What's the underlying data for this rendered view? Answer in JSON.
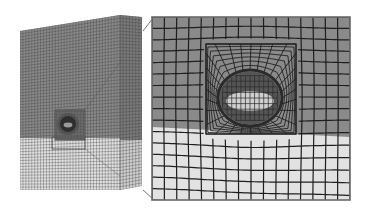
{
  "figure": {
    "colors": {
      "background": "#ffffff",
      "upper_layer": "#8a8a8a",
      "upper_layer_side": "#7a7a7a",
      "lower_layer": "#e2e2e2",
      "lower_layer_side": "#cfcfcf",
      "mesh_line_overview": "#3c3c3c",
      "mesh_line_detail": "#1e1e1e",
      "cavity_core": "#555555",
      "cavity_inner_light": "#cfcfcf",
      "connector_line": "#555555",
      "frame": "#6a6a6a"
    },
    "overview": {
      "front_face": {
        "x0": 20,
        "x1": 120,
        "top_left_y": 31,
        "top_right_y": 15,
        "bottom_y": 190
      },
      "side_face": {
        "x1": 142,
        "top_y": 17,
        "bottom_y": 186
      },
      "layer_interface_y": 138,
      "grid_cols": 34,
      "grid_rows": 54,
      "inset_box": {
        "x": 55,
        "y": 110,
        "w": 30,
        "h": 30
      },
      "detail_marker": {
        "x": 52,
        "y": 137,
        "w": 33,
        "h": 12
      },
      "cavity": {
        "cx": 68,
        "cy": 124,
        "r": 8
      }
    },
    "detail": {
      "frame": {
        "x": 152,
        "y": 17,
        "w": 198,
        "h": 183
      },
      "layer_interface_y_left": 127,
      "layer_interface_y_right": 137,
      "grid_cols": 16,
      "grid_rows": 16,
      "refined_box": {
        "x": 206,
        "y": 44,
        "w": 90,
        "h": 90
      },
      "cavity": {
        "cx": 250,
        "cy": 98,
        "rx": 32,
        "ry": 28
      },
      "cavity_rings": 7,
      "cavity_spokes": 28
    },
    "connectors": [
      {
        "x1": 143,
        "y1": 31,
        "x2": 153,
        "y2": 18
      },
      {
        "x1": 143,
        "y1": 190,
        "x2": 153,
        "y2": 199
      },
      {
        "x1": 85,
        "y1": 110,
        "x2": 122,
        "y2": 60
      },
      {
        "x1": 85,
        "y1": 149,
        "x2": 120,
        "y2": 176
      }
    ]
  }
}
